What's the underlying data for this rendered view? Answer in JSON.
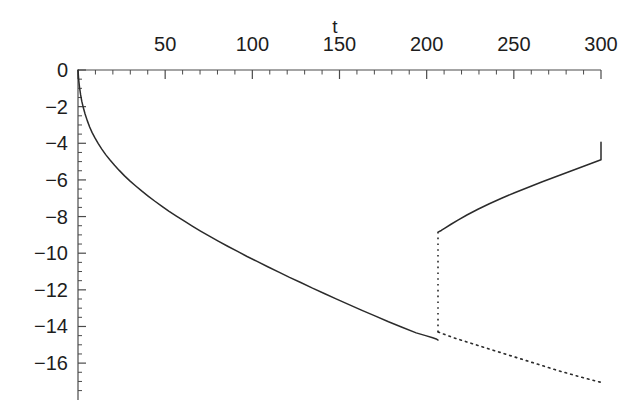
{
  "chart_data": {
    "type": "line",
    "title": "",
    "subtitle": "",
    "xlabel": "t",
    "ylabel": "",
    "xlim": [
      0,
      300
    ],
    "ylim": [
      -17.6,
      0.6
    ],
    "grid": false,
    "legend": null,
    "background_color": "#ffffff",
    "line_color": "#2b2b2b",
    "axis_color": "#4a4a4a",
    "x_ticks_major": [
      0,
      50,
      100,
      150,
      200,
      250,
      300
    ],
    "x_tick_labels": [
      "",
      "50",
      "100",
      "150",
      "200",
      "250",
      "300"
    ],
    "x_ticks_minor_step": 10,
    "y_ticks_major": [
      0,
      -2,
      -4,
      -6,
      -8,
      -10,
      -12,
      -14,
      -16
    ],
    "y_tick_labels": [
      "0",
      "−2",
      "−4",
      "−6",
      "−8",
      "−10",
      "−12",
      "−14",
      "−16"
    ],
    "y_ticks_minor_step": 0.5,
    "annotations": [
      {
        "name": "discontinuity",
        "t": 206.5,
        "y_from": -14.3,
        "y_to": -8.85,
        "style": "dotted-vertical"
      }
    ],
    "series": [
      {
        "name": "main-branch-solid",
        "style": "solid",
        "points": [
          [
            0.0,
            0.0
          ],
          [
            0.6,
            -0.55
          ],
          [
            1.3,
            -0.95
          ],
          [
            2.2,
            -1.35
          ],
          [
            3.2,
            -1.7
          ],
          [
            4.5,
            -2.05
          ],
          [
            6.0,
            -2.4
          ],
          [
            7.8,
            -2.75
          ],
          [
            9.8,
            -3.1
          ],
          [
            12.0,
            -3.42
          ],
          [
            14.5,
            -3.72
          ],
          [
            17.2,
            -4.02
          ],
          [
            20.2,
            -4.32
          ],
          [
            23.5,
            -4.62
          ],
          [
            27.0,
            -4.9
          ],
          [
            31.0,
            -5.2
          ],
          [
            35.0,
            -5.48
          ],
          [
            39.5,
            -5.78
          ],
          [
            44.0,
            -6.05
          ],
          [
            49.0,
            -6.33
          ],
          [
            54.0,
            -6.6
          ],
          [
            59.5,
            -6.88
          ],
          [
            65.0,
            -7.15
          ],
          [
            71.0,
            -7.43
          ],
          [
            77.0,
            -7.7
          ],
          [
            83.5,
            -7.97
          ],
          [
            90.0,
            -8.24
          ],
          [
            97.0,
            -8.52
          ],
          [
            104.0,
            -8.79
          ],
          [
            111.5,
            -9.07
          ],
          [
            119.0,
            -9.34
          ],
          [
            127.0,
            -9.62
          ],
          [
            135.0,
            -9.89
          ],
          [
            143.5,
            -10.18
          ],
          [
            152.0,
            -10.45
          ],
          [
            161.0,
            -10.74
          ],
          [
            170.0,
            -11.02
          ],
          [
            179.5,
            -11.32
          ],
          [
            189.0,
            -11.6
          ],
          [
            199.0,
            -11.91
          ],
          [
            209.0,
            -12.2
          ],
          [
            219.5,
            -12.51
          ],
          [
            230.0,
            -12.81
          ],
          [
            241.0,
            -13.12
          ],
          [
            252.0,
            -13.42
          ],
          [
            263.5,
            -13.74
          ],
          [
            275.0,
            -14.04
          ],
          [
            287.0,
            -14.35
          ],
          [
            295.0,
            -14.5
          ],
          [
            301.0,
            -14.62
          ],
          [
            304.0,
            -14.68
          ],
          [
            305.5,
            -14.74
          ]
        ],
        "note": "plotted over pixel-x 78 to 437 (t 0 to ~206.5)"
      },
      {
        "name": "upper-branch-solid",
        "style": "solid",
        "points": [
          [
            206.5,
            -8.85
          ],
          [
            208.5,
            -8.76
          ],
          [
            211.0,
            -8.62
          ],
          [
            214.5,
            -8.42
          ],
          [
            219.0,
            -8.18
          ],
          [
            224.5,
            -7.9
          ],
          [
            231.0,
            -7.6
          ],
          [
            238.0,
            -7.3
          ],
          [
            245.5,
            -7.0
          ],
          [
            253.5,
            -6.7
          ],
          [
            262.0,
            -6.4
          ],
          [
            270.5,
            -6.1
          ],
          [
            279.5,
            -5.8
          ],
          [
            288.5,
            -5.5
          ],
          [
            297.5,
            -5.2
          ],
          [
            306.5,
            -4.9
          ],
          [
            300.0,
            -3.95
          ]
        ],
        "note": "rising solid branch after the jump, ends at t=300, y=-4"
      },
      {
        "name": "lower-branch-dotted",
        "style": "dotted",
        "points": [
          [
            206.5,
            -14.3
          ],
          [
            215.0,
            -14.6
          ],
          [
            230.0,
            -15.05
          ],
          [
            245.0,
            -15.5
          ],
          [
            260.0,
            -15.95
          ],
          [
            275.0,
            -16.4
          ],
          [
            290.0,
            -16.8
          ],
          [
            300.0,
            -17.05
          ]
        ],
        "note": "dotted continuation of the lower branch to t=300, y=-17"
      }
    ]
  },
  "axes": {
    "x_axis_name": "t",
    "x_axis_position": "top",
    "y_axis_position": "left"
  }
}
